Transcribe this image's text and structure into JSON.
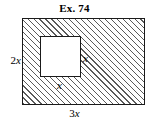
{
  "figure": {
    "title": "Ex. 74",
    "labels": {
      "outer_height": "2x",
      "outer_height_coefficient": "2",
      "outer_height_variable": "x",
      "outer_width": "3x",
      "outer_width_coefficient": "3",
      "outer_width_variable": "x",
      "inner_right": "x",
      "inner_bottom": "x"
    },
    "colors": {
      "stroke": "#1a1a1a",
      "hatch": "#5a5a5a",
      "background": "#ffffff",
      "inner_fill": "#ffffff"
    }
  },
  "chart_data": {
    "type": "diagram",
    "title": "Ex. 74",
    "shapes": [
      {
        "name": "outer-rectangle",
        "kind": "rectangle",
        "fill": "hatched",
        "hatch_angle_degrees": 45,
        "width_label": "3x",
        "height_label": "2x",
        "width_expression": "3x",
        "height_expression": "2x"
      },
      {
        "name": "inner-square",
        "kind": "square",
        "fill": "white",
        "side_label": "x",
        "side_expression": "x",
        "labeled_sides": [
          "right",
          "bottom"
        ]
      }
    ],
    "shaded_area_expression": "3x · 2x − x · x"
  }
}
